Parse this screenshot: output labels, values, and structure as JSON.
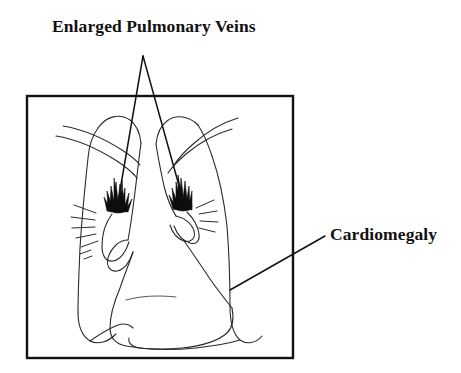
{
  "figure": {
    "type": "medical-line-illustration",
    "background_color": "#ffffff",
    "ink_color": "#111111",
    "frame": {
      "name": "radiograph-border",
      "x": 27,
      "y": 96,
      "width": 266,
      "height": 262,
      "stroke_width": 2.4
    }
  },
  "annotations": [
    {
      "id": "enlarged-pulmonary-veins",
      "label": "Enlarged Pulmonary Veins",
      "text_x": 52,
      "text_y": 18,
      "font_size": 17.5,
      "bold": true,
      "leader_apex": {
        "x": 143,
        "y": 56
      },
      "leader_targets": [
        {
          "x": 117,
          "y": 208
        },
        {
          "x": 183,
          "y": 200
        }
      ]
    },
    {
      "id": "cardiomegaly",
      "label": "Cardiomegaly",
      "text_x": 330,
      "text_y": 226,
      "font_size": 17.5,
      "bold": true,
      "leader_start": {
        "x": 230,
        "y": 290
      },
      "leader_end": {
        "x": 325,
        "y": 236
      }
    }
  ],
  "anatomy": {
    "left_hilum_marker": {
      "name": "enlarged-vein-brush-left",
      "cx": 118,
      "cy": 198,
      "fill": "#0d0d0d"
    },
    "right_hilum_marker": {
      "name": "enlarged-vein-brush-right",
      "cx": 183,
      "cy": 196,
      "fill": "#0d0d0d"
    },
    "structures": [
      "left-lung-field",
      "right-lung-field",
      "left-clavicle",
      "right-clavicle",
      "enlarged-cardiac-silhouette",
      "left-hemidiaphragm",
      "right-hemidiaphragm",
      "left-hilar-vessels",
      "right-hilar-vessels",
      "kerley-lines-left",
      "kerley-lines-right"
    ]
  }
}
